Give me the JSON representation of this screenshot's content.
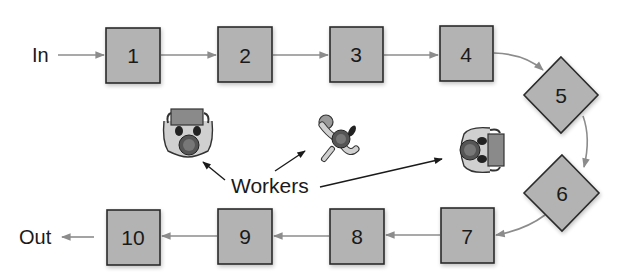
{
  "diagram": {
    "input_label": "In",
    "output_label": "Out",
    "workers_label": "Workers",
    "stations": [
      {
        "id": "1",
        "label": "1",
        "shape": "square"
      },
      {
        "id": "2",
        "label": "2",
        "shape": "square"
      },
      {
        "id": "3",
        "label": "3",
        "shape": "square"
      },
      {
        "id": "4",
        "label": "4",
        "shape": "square"
      },
      {
        "id": "5",
        "label": "5",
        "shape": "diamond"
      },
      {
        "id": "6",
        "label": "6",
        "shape": "diamond"
      },
      {
        "id": "7",
        "label": "7",
        "shape": "square"
      },
      {
        "id": "8",
        "label": "8",
        "shape": "square"
      },
      {
        "id": "9",
        "label": "9",
        "shape": "square"
      },
      {
        "id": "10",
        "label": "10",
        "shape": "square"
      }
    ],
    "colors": {
      "station_fill": "#b3b3b3",
      "station_stroke": "#2a2a2a",
      "flow_arrow": "#8c8c8c",
      "pointer_arrow": "#1a1a1a"
    }
  }
}
